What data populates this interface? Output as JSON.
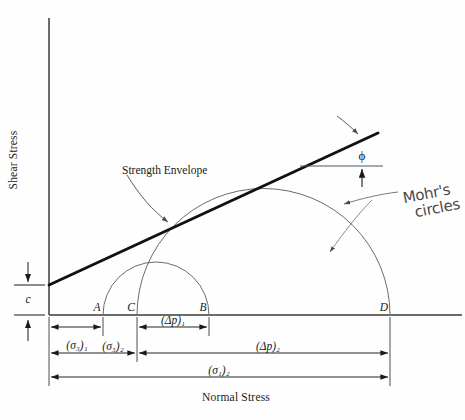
{
  "figure": {
    "axes": {
      "y_title": "Shear Stress",
      "x_title": "Normal Stress"
    },
    "annotations": {
      "envelope": "Strength Envelope",
      "friction_angle": "ϕ",
      "cohesion": "c",
      "mohr_line1": "Mohr's",
      "mohr_line2": "circles"
    },
    "points": [
      {
        "name": "A",
        "label": "A",
        "x": 103
      },
      {
        "name": "C",
        "label": "C",
        "x": 137
      },
      {
        "name": "B",
        "label": "B",
        "x": 209
      },
      {
        "name": "D",
        "label": "D",
        "x": 390
      }
    ],
    "dimensions": [
      {
        "name": "delta-p-1",
        "label": "(Δp)₁",
        "from": "C",
        "to": "B",
        "row": 1
      },
      {
        "name": "sigma-3-1",
        "label": "(σ₃)₁",
        "from": "origin",
        "to": "A",
        "row": 1
      },
      {
        "name": "sigma-3-2",
        "label": "(σ₃)₂",
        "from": "origin",
        "to": "C",
        "row": 2
      },
      {
        "name": "delta-p-2",
        "label": "(Δp)₂",
        "from": "C",
        "to": "D",
        "row": 2
      },
      {
        "name": "sigma-1-2",
        "label": "(σ₁)₂",
        "from": "origin",
        "to": "D",
        "row": 3
      }
    ],
    "circles": [
      {
        "name": "mohr-circle-1",
        "left": 103,
        "right": 209,
        "center": 156,
        "radius": 53
      },
      {
        "name": "mohr-circle-2",
        "left": 137,
        "right": 390,
        "center": 263.5,
        "radius": 126.5
      }
    ],
    "envelope_line": {
      "x1": 49,
      "y1": 285,
      "x2": 378,
      "y2": 133
    },
    "colors": {
      "ink": "#1a1a1a",
      "axis": "#3a3a3a",
      "circle": "#6b6b6b",
      "handwriting": "#4a4a4a"
    }
  }
}
